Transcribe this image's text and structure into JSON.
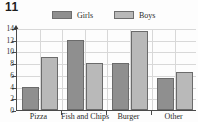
{
  "question_number": "11",
  "legend": {
    "position": "top-center",
    "entries": [
      {
        "label": "Girls",
        "color": "#8f8f8f",
        "icon": "legend-swatch-icon"
      },
      {
        "label": "Boys",
        "color": "#b9b9b9",
        "icon": "legend-swatch-icon"
      }
    ]
  },
  "chart_data": {
    "type": "bar",
    "title": "",
    "xlabel": "",
    "ylabel": "",
    "categories": [
      "Pizza",
      "Fish and Chips",
      "Burger",
      "Other"
    ],
    "series": [
      {
        "name": "Girls",
        "color": "#8f8f8f",
        "values": [
          4,
          12,
          8,
          5.5
        ]
      },
      {
        "name": "Boys",
        "color": "#b9b9b9",
        "values": [
          9,
          8,
          13.5,
          6.5
        ]
      }
    ],
    "ylim": [
      0,
      14
    ],
    "yticks": [
      0,
      2,
      4,
      6,
      8,
      10,
      12,
      14
    ],
    "ytick_labels": [
      "0",
      "2",
      "4",
      "6",
      "8",
      "10",
      "12",
      "14"
    ],
    "grid": true,
    "grid_axis": "both",
    "legend_position": "top-center"
  }
}
